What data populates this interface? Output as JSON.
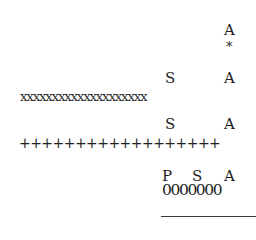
{
  "block1": {
    "top_label": "A",
    "marker": "*"
  },
  "block2": {
    "labels": [
      "S",
      "A"
    ],
    "row": "xxxxxxxxxxxxxxxxxxxx"
  },
  "block3": {
    "labels": [
      "S",
      "A"
    ],
    "row": "++++++++++++++++++"
  },
  "block4": {
    "labels": [
      "P",
      "S",
      "A"
    ],
    "row": "0000000"
  },
  "colors": {
    "text": "#1e1e1e",
    "background": "#ffffff",
    "rule": "#3a3a3a"
  }
}
